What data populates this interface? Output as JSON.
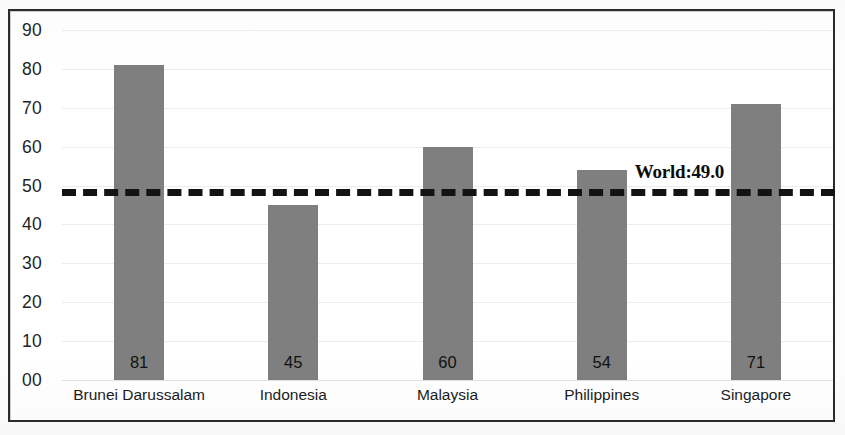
{
  "chart_data": {
    "type": "bar",
    "title": "",
    "subtitle": "",
    "xlabel": "",
    "ylabel": "",
    "categories": [
      "Brunei Darussalam",
      "Indonesia",
      "Malaysia",
      "Philippines",
      "Singapore"
    ],
    "values": [
      81,
      45,
      60,
      54,
      71
    ],
    "value_labels": [
      "81",
      "45",
      "60",
      "54",
      "71"
    ],
    "ylim": [
      0,
      90
    ],
    "ytick_values": [
      90,
      80,
      70,
      60,
      50,
      40,
      30,
      20,
      10,
      0
    ],
    "ytick_labels": [
      "90",
      "80",
      "70",
      "60",
      "50",
      "40",
      "30",
      "20",
      "10",
      "00"
    ],
    "grid": true,
    "legend": "none",
    "bar_color": "#7f7f7f",
    "annotations": [
      {
        "name": "world-average-reference-line",
        "label": "World:49.0",
        "value": 49.0,
        "style": "dashed",
        "color": "#131313"
      }
    ]
  },
  "frame": {
    "border_color": "#2b2b2b"
  }
}
